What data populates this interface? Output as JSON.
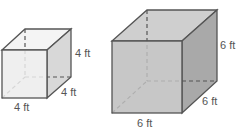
{
  "figures": [
    {
      "name": "small-cube",
      "edge": "4 ft",
      "labels": {
        "height": "4 ft",
        "depth": "4 ft",
        "width": "4 ft"
      }
    },
    {
      "name": "large-cube",
      "edge": "6 ft",
      "labels": {
        "height": "6 ft",
        "depth": "6 ft",
        "width": "6 ft"
      }
    }
  ],
  "colors": {
    "small_face": "#ececec",
    "small_side": "#d8d8d8",
    "small_top": "#f4f4f4",
    "large_face": "#bdbdbd",
    "large_side": "#a9a9a9",
    "large_top": "#cfcfcf",
    "edge": "#555555"
  }
}
